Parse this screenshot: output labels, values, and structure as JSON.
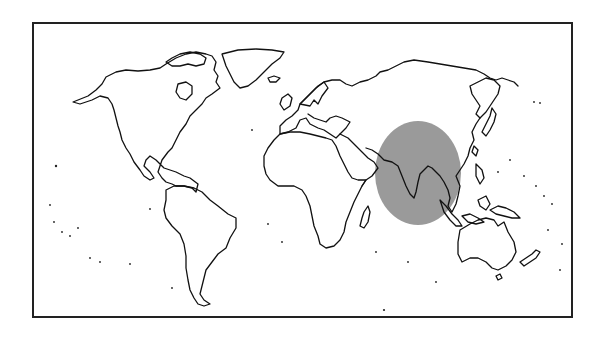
{
  "figure": {
    "type": "world-map-outline",
    "projection": "equirectangular-like",
    "frame": {
      "x": 32,
      "y": 22,
      "width": 540,
      "height": 295,
      "stroke": "#222222",
      "stroke_width": 2
    },
    "background": "#ffffff",
    "coast_color": "#111111"
  },
  "highlight": {
    "name": "south-and-southeast-asia-region",
    "shape": "ellipse",
    "cx": 418,
    "cy": 173,
    "rx": 43,
    "ry": 52,
    "fill": "#9a9a9a",
    "covers": [
      "Arabian Sea coast",
      "India",
      "Bay of Bengal",
      "Indochina",
      "Malay Peninsula"
    ]
  },
  "regions": [
    "North America",
    "Greenland",
    "South America",
    "Europe",
    "Africa",
    "Madagascar",
    "Asia",
    "Japan",
    "Indonesia",
    "Australia",
    "New Zealand"
  ]
}
